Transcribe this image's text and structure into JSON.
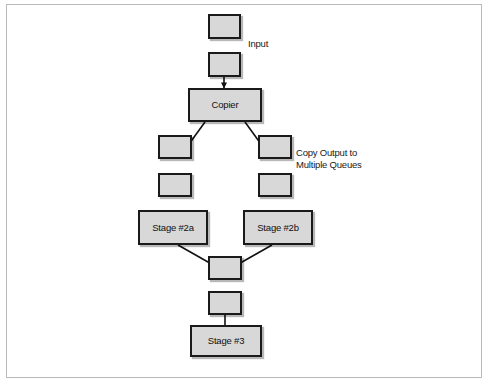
{
  "diagram": {
    "colors": {
      "node_fill": "#d8d8d8",
      "node_border": "#1a1a1a",
      "frame_border": "#b9b9b9",
      "arrow": "#111111",
      "background": "#ffffff"
    },
    "nodes": {
      "input_queue_top": "",
      "input_queue_bottom": "",
      "copier": "Copier",
      "left_queue_upper": "",
      "right_queue_upper": "",
      "left_queue_lower": "",
      "right_queue_lower": "",
      "stage_2a": "Stage #2a",
      "stage_2b": "Stage #2b",
      "merge_queue_upper": "",
      "merge_queue_lower": "",
      "stage_3": "Stage #3"
    },
    "labels": {
      "input": "Input",
      "copy_output": "Copy Output to\nMultiple Queues"
    }
  }
}
